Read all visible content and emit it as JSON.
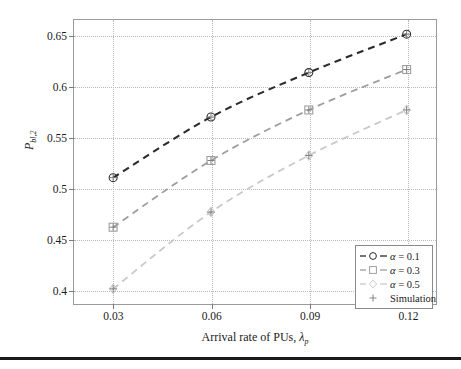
{
  "chart_data": {
    "type": "line",
    "title": "",
    "xlabel": "Arrival rate of PUs, λ_p",
    "ylabel": "P_bl,2",
    "x": [
      0.03,
      0.06,
      0.09,
      0.12
    ],
    "xlim": [
      0.018,
      0.129
    ],
    "ylim": [
      0.385,
      0.666
    ],
    "xticks": [
      0.03,
      0.06,
      0.09,
      0.12
    ],
    "yticks": [
      0.4,
      0.45,
      0.5,
      0.55,
      0.6,
      0.65
    ],
    "xticklabels": [
      "0.03",
      "0.06",
      "0.09",
      "0.12"
    ],
    "yticklabels": [
      "0.4",
      "0.45",
      "0.5",
      "0.55",
      "0.6",
      "0.65"
    ],
    "grid": true,
    "grid_style": "dotted",
    "legend_position": "lower right",
    "series": [
      {
        "name": "α = 0.1",
        "marker": "circle",
        "linestyle": "dashed",
        "color": "#2b2b2b",
        "values": [
          0.51,
          0.57,
          0.614,
          0.652
        ]
      },
      {
        "name": "α = 0.3",
        "marker": "square",
        "linestyle": "dashed",
        "color": "#9e9e9e",
        "values": [
          0.461,
          0.527,
          0.577,
          0.617
        ]
      },
      {
        "name": "α = 0.5",
        "marker": "diamond",
        "linestyle": "dashed",
        "color": "#c9c9c9",
        "values": [
          0.4,
          0.476,
          0.532,
          0.577
        ]
      }
    ],
    "simulation": {
      "name": "Simulation",
      "marker": "plus",
      "color": "#8a8a8a"
    }
  },
  "axis_titles": {
    "y": "P",
    "y_sub": "bl,2",
    "x_prefix": "Arrival rate of PUs, ",
    "x_symbol": "λ",
    "x_symbol_sub": "p"
  },
  "legend": {
    "entries": [
      {
        "label_symbol": "α",
        "label_rest": " = 0.1",
        "marker": "circle-marker",
        "line": true
      },
      {
        "label_symbol": "α",
        "label_rest": " = 0.3",
        "marker": "square-marker",
        "line": true
      },
      {
        "label_symbol": "α",
        "label_rest": " = 0.5",
        "marker": "diamond-marker",
        "line": true
      },
      {
        "label_symbol": "",
        "label_rest": "Simulation",
        "marker": "plus-marker",
        "line": false
      }
    ]
  }
}
